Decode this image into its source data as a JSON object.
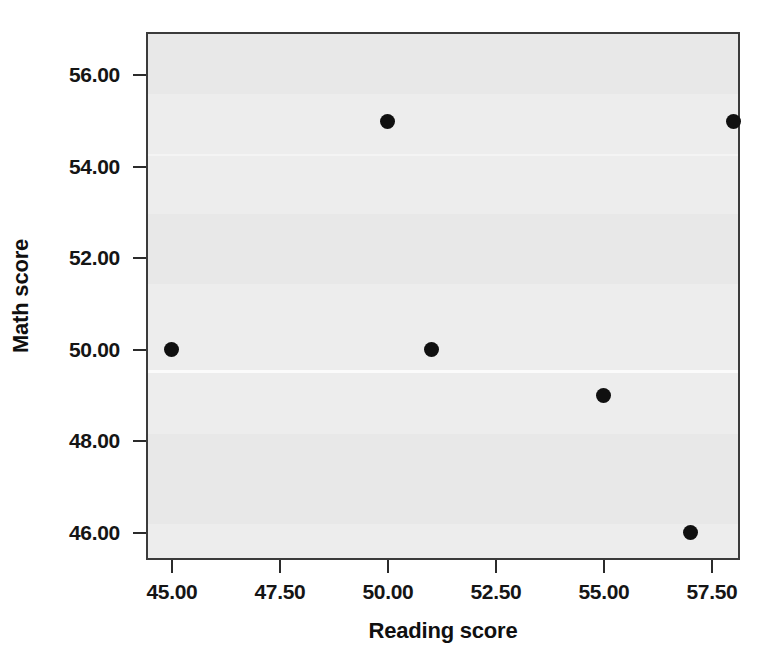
{
  "chart_data": {
    "type": "scatter",
    "title": "",
    "xlabel": "Reading score",
    "ylabel": "Math score",
    "xlim": [
      44.4,
      58.15
    ],
    "ylim": [
      45.4,
      56.95
    ],
    "xticks": [
      "45.00",
      "47.50",
      "50.00",
      "52.50",
      "55.00",
      "57.50"
    ],
    "xtick_values": [
      45.0,
      47.5,
      50.0,
      52.5,
      55.0,
      57.5
    ],
    "yticks": [
      "46.00",
      "48.00",
      "50.00",
      "52.00",
      "54.00",
      "56.00"
    ],
    "ytick_values": [
      46.0,
      48.0,
      50.0,
      52.0,
      54.0,
      56.0
    ],
    "grid": false,
    "legend": null,
    "marker": "filled-circle",
    "marker_color": "#101010",
    "plot_background": "#ededed",
    "points": [
      {
        "x": 45.0,
        "y": 50.0
      },
      {
        "x": 50.0,
        "y": 55.0
      },
      {
        "x": 51.0,
        "y": 50.0
      },
      {
        "x": 55.0,
        "y": 49.0
      },
      {
        "x": 57.0,
        "y": 46.0
      },
      {
        "x": 58.0,
        "y": 55.0
      }
    ],
    "series": [
      {
        "name": "",
        "x": [
          45.0,
          50.0,
          51.0,
          55.0,
          57.0,
          58.0
        ],
        "values": [
          50.0,
          55.0,
          50.0,
          49.0,
          46.0,
          55.0
        ]
      }
    ]
  }
}
